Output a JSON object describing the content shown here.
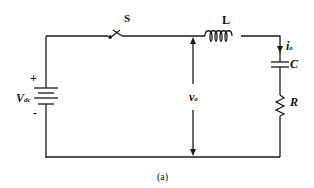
{
  "diagram": {
    "type": "circuit",
    "caption": "(a)",
    "components": {
      "source": {
        "label": "V",
        "subscript": "dc",
        "plus": "+",
        "minus": "-"
      },
      "switch": {
        "label": "S"
      },
      "inductor": {
        "label": "L"
      },
      "capacitor": {
        "label": "C"
      },
      "resistor": {
        "label": "R"
      }
    },
    "annotations": {
      "output_voltage": {
        "label": "v",
        "subscript": "o"
      },
      "output_current": {
        "label": "i",
        "subscript": "o"
      }
    },
    "colors": {
      "wire": "#1a1a1a",
      "background": "#ffffff"
    }
  }
}
